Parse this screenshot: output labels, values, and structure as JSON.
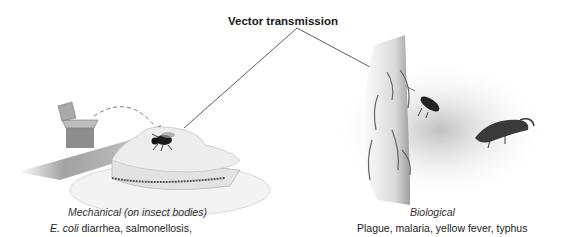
{
  "diagram": {
    "title": "Vector transmission",
    "branches": [
      {
        "label": "Mechanical (on insect bodies)",
        "examples_italic": "E. coli",
        "examples_rest": " diarrhea, salmonellosis,",
        "illustration": "fly-on-sandwich-from-trash-can"
      },
      {
        "label": "Biological",
        "examples": "Plague, malaria, yellow fever, typhus",
        "illustration": "flea-on-animal-fur-and-rodent"
      }
    ]
  },
  "colors": {
    "line": "#333333",
    "text": "#1a1a1a",
    "shading": "#9a9a9a"
  }
}
